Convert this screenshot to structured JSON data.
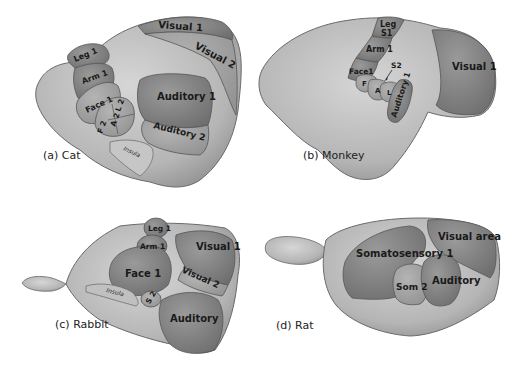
{
  "figure": {
    "panels": [
      {
        "id": "a",
        "caption": "(a) Cat",
        "areas": [
          "Visual 1",
          "Visual 2",
          "Leg 1",
          "Arm 1",
          "Face 1",
          "L 2",
          "A 2",
          "F 2",
          "Auditory 1",
          "Auditory 2",
          "Insula"
        ]
      },
      {
        "id": "b",
        "caption": "(b) Monkey",
        "areas": [
          "Leg",
          "S1",
          "Arm 1",
          "Face1",
          "S2",
          "F",
          "A",
          "L",
          "Auditory 1",
          "Visual 1"
        ]
      },
      {
        "id": "c",
        "caption": "(c) Rabbit",
        "areas": [
          "Leg 1",
          "Arm 1",
          "Face 1",
          "Visual 1",
          "Visual 2",
          "Insula",
          "S 2",
          "Auditory"
        ]
      },
      {
        "id": "d",
        "caption": "(d) Rat",
        "areas": [
          "Visual area",
          "Somatosensory 1",
          "Som 2",
          "Auditory"
        ]
      }
    ],
    "colors": {
      "cortex": "#b8b8b8",
      "cortex_light": "#d2d2d2",
      "primary_area": "#8a8a8a",
      "secondary_area": "#a6a6a6",
      "outline": "#555555"
    }
  }
}
